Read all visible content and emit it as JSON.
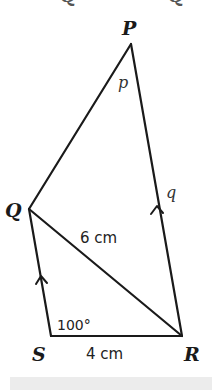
{
  "diagram": {
    "type": "quadrilateral",
    "vertices": {
      "P": {
        "label": "P"
      },
      "Q": {
        "label": "Q"
      },
      "R": {
        "label": "R"
      },
      "S": {
        "label": "S"
      }
    },
    "edges": [
      "PQ",
      "PR",
      "QS",
      "SR",
      "QR"
    ],
    "angles": {
      "at_P": "p",
      "at_PR": "q",
      "at_S": "100°"
    },
    "measurements": {
      "QR": "6 cm",
      "SR": "4 cm"
    },
    "parallel_marks": [
      "QS",
      "PR"
    ],
    "top_fragment": [
      "Q",
      "Q"
    ]
  },
  "colors": {
    "line": "#1a1a1a",
    "background": "#ffffff",
    "band": "#ececec"
  }
}
